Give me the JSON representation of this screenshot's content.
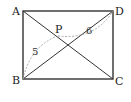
{
  "figure": {
    "type": "geometry-rectangle-with-point",
    "points": {
      "A": {
        "label": "A",
        "x": 23,
        "y": 11
      },
      "B": {
        "label": "B",
        "x": 23,
        "y": 79
      },
      "C": {
        "label": "C",
        "x": 113,
        "y": 79
      },
      "D": {
        "label": "D",
        "x": 113,
        "y": 11
      },
      "P": {
        "label": "P",
        "x": 57,
        "y": 36
      }
    },
    "segments": [
      {
        "from": "A",
        "to": "B"
      },
      {
        "from": "B",
        "to": "C"
      },
      {
        "from": "C",
        "to": "D"
      },
      {
        "from": "D",
        "to": "A"
      },
      {
        "from": "A",
        "to": "C"
      },
      {
        "from": "B",
        "to": "D"
      }
    ],
    "measurements": [
      {
        "segment": "BP",
        "value": "5"
      },
      {
        "segment": "PD",
        "value": "6"
      }
    ],
    "colors": {
      "stroke": "#333333",
      "measure_curve": "#aaaaaa"
    }
  }
}
